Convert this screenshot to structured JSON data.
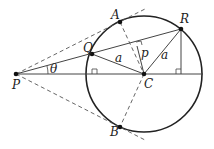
{
  "diagram": {
    "labels": {
      "A": "A",
      "B": "B",
      "C": "C",
      "P": "P",
      "Q": "Q",
      "R": "R",
      "radius_QC": "a",
      "radius_RC": "a",
      "perpendicular": "p",
      "angle": "θ"
    },
    "colors": {
      "stroke": "#222222",
      "background": "#ffffff"
    }
  }
}
